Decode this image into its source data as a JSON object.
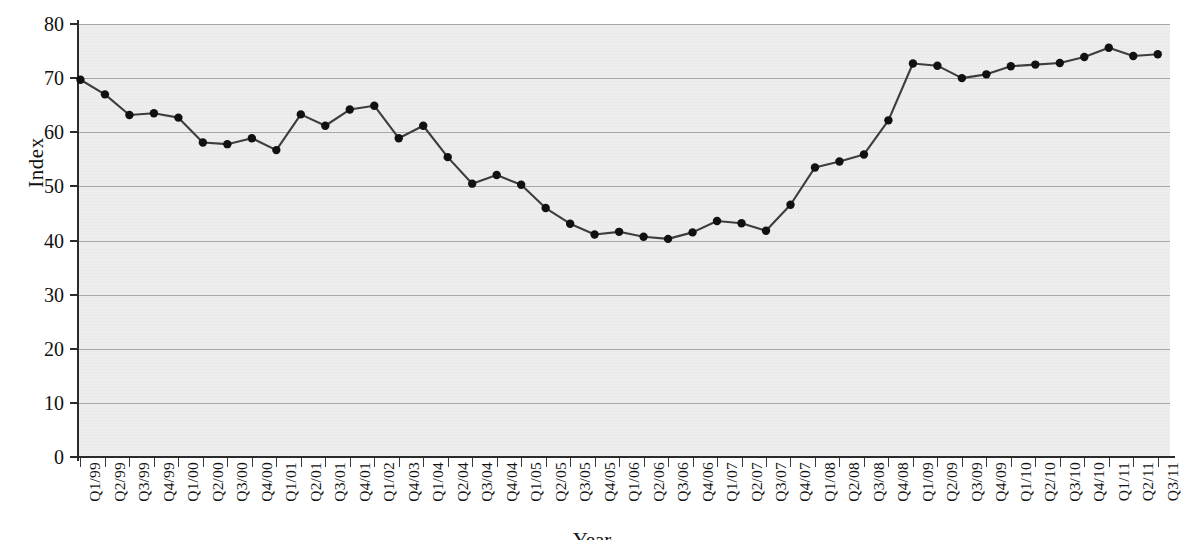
{
  "chart_data": {
    "type": "line",
    "title": "",
    "xlabel": "Year",
    "ylabel": "Index",
    "ylim": [
      0,
      80
    ],
    "ytick_values": [
      0,
      10,
      20,
      30,
      40,
      50,
      60,
      70,
      80
    ],
    "grid": true,
    "legend": null,
    "marker": "filled-circle",
    "line_color": "#3d3d3d",
    "marker_color": "#111111",
    "plot_background": "#eeeeee",
    "categories": [
      "Q1/99",
      "Q2/99",
      "Q3/99",
      "Q4/99",
      "Q1/00",
      "Q2/00",
      "Q3/00",
      "Q4/00",
      "Q1/01",
      "Q2/01",
      "Q3/01",
      "Q4/01",
      "Q1/02",
      "Q4/03",
      "Q1/04",
      "Q2/04",
      "Q3/04",
      "Q4/04",
      "Q1/05",
      "Q2/05",
      "Q3/05",
      "Q4/05",
      "Q1/06",
      "Q2/06",
      "Q3/06",
      "Q4/06",
      "Q1/07",
      "Q2/07",
      "Q3/07",
      "Q4/07",
      "Q1/08",
      "Q2/08",
      "Q3/08",
      "Q4/08",
      "Q1/09",
      "Q2/09",
      "Q3/09",
      "Q4/09",
      "Q1/10",
      "Q2/10",
      "Q3/10",
      "Q4/10",
      "Q1/11",
      "Q2/11",
      "Q3/11"
    ],
    "values": [
      69.7,
      67.0,
      63.2,
      63.5,
      62.7,
      58.1,
      57.8,
      58.9,
      56.7,
      63.3,
      61.2,
      64.2,
      64.9,
      58.9,
      61.2,
      55.4,
      50.5,
      52.1,
      50.3,
      46.0,
      43.1,
      41.1,
      41.6,
      40.7,
      40.3,
      41.5,
      43.6,
      43.2,
      41.8,
      46.6,
      53.5,
      54.6,
      55.9,
      62.2,
      72.7,
      72.3,
      70.0,
      70.7,
      72.2,
      72.5,
      72.8,
      73.9,
      75.6,
      74.1,
      74.4
    ]
  },
  "axes": {
    "y_label": "Index",
    "x_label": "Year"
  }
}
